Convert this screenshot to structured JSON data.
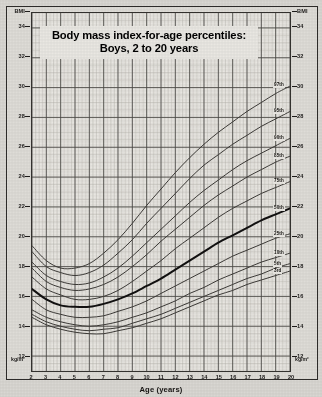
{
  "title": {
    "line1": "Body mass index-for-age percentiles:",
    "line2": "Boys, 2 to 20 years"
  },
  "axes": {
    "y_label_top_left": "BMI",
    "y_label_top_right": "BMI",
    "y_unit_left": "kg/m²",
    "y_unit_right": "kg/m²",
    "x_title": "Age (years)",
    "y_ticks": [
      "34",
      "32",
      "30",
      "28",
      "26",
      "24",
      "22",
      "20",
      "18",
      "16",
      "14",
      "12"
    ],
    "x_ticks": [
      "2",
      "3",
      "4",
      "5",
      "6",
      "7",
      "8",
      "9",
      "10",
      "11",
      "12",
      "13",
      "14",
      "15",
      "16",
      "17",
      "18",
      "19",
      "20"
    ]
  },
  "colors": {
    "paper": "#d9d7d2",
    "plot_bg": "#e7e5e0",
    "ink": "#1d1b1a",
    "curve": "#3a3835",
    "curve_bold": "#111010",
    "grid_major": "#4a4845",
    "grid_minor": "#b8b5ae"
  },
  "chart_data": {
    "type": "line",
    "title": "Body mass index-for-age percentiles: Boys, 2 to 20 years",
    "xlabel": "Age (years)",
    "ylabel": "BMI",
    "yunit": "kg/m²",
    "xlim": [
      2,
      20
    ],
    "ylim": [
      11,
      35
    ],
    "grid": true,
    "legend": "right-of-curves",
    "x": [
      2,
      3,
      4,
      5,
      6,
      7,
      8,
      9,
      10,
      11,
      12,
      13,
      14,
      15,
      16,
      17,
      18,
      19,
      20
    ],
    "series": [
      {
        "name": "97th",
        "label": "97th",
        "bold": false,
        "values": [
          19.4,
          18.4,
          17.9,
          17.9,
          18.2,
          18.9,
          19.8,
          20.9,
          22.1,
          23.2,
          24.3,
          25.3,
          26.2,
          27.0,
          27.7,
          28.4,
          29.0,
          29.6,
          30.1
        ]
      },
      {
        "name": "95th",
        "label": "95th",
        "bold": false,
        "values": [
          19.0,
          18.0,
          17.6,
          17.4,
          17.6,
          18.1,
          18.9,
          19.8,
          20.9,
          21.9,
          22.9,
          23.9,
          24.8,
          25.5,
          26.2,
          26.8,
          27.4,
          27.9,
          28.4
        ]
      },
      {
        "name": "90th",
        "label": "90th",
        "bold": false,
        "values": [
          18.3,
          17.4,
          17.0,
          16.8,
          16.9,
          17.3,
          17.9,
          18.7,
          19.6,
          20.5,
          21.4,
          22.3,
          23.1,
          23.8,
          24.5,
          25.1,
          25.6,
          26.1,
          26.6
        ]
      },
      {
        "name": "85th",
        "label": "85th",
        "bold": false,
        "values": [
          17.9,
          17.0,
          16.6,
          16.4,
          16.5,
          16.8,
          17.3,
          18.0,
          18.8,
          19.7,
          20.5,
          21.3,
          22.1,
          22.8,
          23.4,
          24.0,
          24.5,
          25.0,
          25.4
        ]
      },
      {
        "name": "75th",
        "label": "75th",
        "bold": false,
        "values": [
          17.3,
          16.5,
          16.1,
          15.8,
          15.8,
          16.0,
          16.4,
          17.0,
          17.7,
          18.4,
          19.2,
          19.9,
          20.6,
          21.3,
          21.9,
          22.4,
          22.9,
          23.3,
          23.7
        ]
      },
      {
        "name": "50th",
        "label": "50th",
        "bold": true,
        "values": [
          16.5,
          15.8,
          15.4,
          15.3,
          15.3,
          15.5,
          15.8,
          16.2,
          16.7,
          17.2,
          17.8,
          18.4,
          19.0,
          19.6,
          20.1,
          20.6,
          21.1,
          21.5,
          21.9
        ]
      },
      {
        "name": "25th",
        "label": "25th",
        "bold": false,
        "values": [
          15.8,
          15.1,
          14.8,
          14.6,
          14.6,
          14.7,
          15.0,
          15.3,
          15.7,
          16.2,
          16.7,
          17.2,
          17.7,
          18.2,
          18.7,
          19.1,
          19.5,
          19.9,
          20.2
        ]
      },
      {
        "name": "10th",
        "label": "10th",
        "bold": false,
        "values": [
          15.1,
          14.6,
          14.3,
          14.1,
          14.0,
          14.1,
          14.3,
          14.6,
          14.9,
          15.3,
          15.7,
          16.2,
          16.6,
          17.1,
          17.5,
          17.9,
          18.3,
          18.6,
          18.9
        ]
      },
      {
        "name": "5th",
        "label": "5th",
        "bold": false,
        "values": [
          14.8,
          14.3,
          14.0,
          13.8,
          13.7,
          13.8,
          13.9,
          14.2,
          14.5,
          14.8,
          15.2,
          15.6,
          16.0,
          16.4,
          16.8,
          17.2,
          17.5,
          17.9,
          18.2
        ]
      },
      {
        "name": "3rd",
        "label": "3rd",
        "bold": false,
        "values": [
          14.6,
          14.1,
          13.8,
          13.6,
          13.5,
          13.5,
          13.7,
          13.9,
          14.2,
          14.5,
          14.9,
          15.3,
          15.7,
          16.1,
          16.4,
          16.8,
          17.1,
          17.4,
          17.7
        ]
      }
    ]
  }
}
